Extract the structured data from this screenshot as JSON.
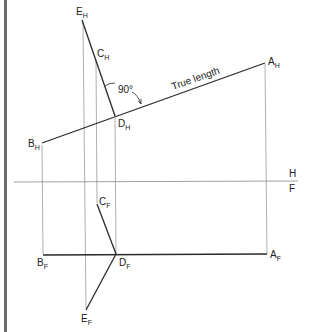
{
  "diagram": {
    "colors": {
      "object_line": "#2a2a2a",
      "projection_line": "#9a9a9a",
      "border": "#666666",
      "text": "#222222"
    },
    "reference_line": {
      "upper_label": "H",
      "lower_label": "F"
    },
    "annotations": {
      "angle": "90°",
      "true_length": "True length"
    },
    "points": {
      "E_H": {
        "main": "E",
        "sub": "H",
        "x": 82,
        "y": 20
      },
      "C_H": {
        "main": "C",
        "sub": "H",
        "x": 96,
        "y": 57
      },
      "D_H": {
        "main": "D",
        "sub": "H",
        "x": 115,
        "y": 116
      },
      "B_H": {
        "main": "B",
        "sub": "H",
        "x": 42,
        "y": 143
      },
      "A_H": {
        "main": "A",
        "sub": "H",
        "x": 265,
        "y": 63
      },
      "C_F": {
        "main": "C",
        "sub": "F",
        "x": 97,
        "y": 204
      },
      "D_F": {
        "main": "D",
        "sub": "F",
        "x": 116,
        "y": 254
      },
      "B_F": {
        "main": "B",
        "sub": "F",
        "x": 43,
        "y": 254
      },
      "A_F": {
        "main": "A",
        "sub": "F",
        "x": 267,
        "y": 254
      },
      "E_F": {
        "main": "E",
        "sub": "F",
        "x": 86,
        "y": 310
      }
    }
  }
}
